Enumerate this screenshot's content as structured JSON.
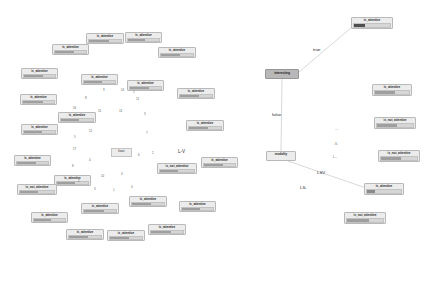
{
  "meta": {
    "left_panel_name": "attention-node-cluster",
    "right_panel_name": "decision-tree"
  },
  "labels": {
    "is_attentive": "is_attentive",
    "is_not_attentive": "is_not_attentive",
    "interesting": "interesting",
    "modality": "modality",
    "true": "true",
    "false": "false",
    "hour": "hour",
    "l_v": "L-V",
    "lsv": "LSV",
    "ls": "LS-",
    "l_dash": "L--",
    "s_dash": "-S-",
    "dash_dash": "---"
  },
  "left_cluster": {
    "nodes": [
      {
        "label": "is_attentive",
        "x": 86,
        "y": 33,
        "w": 38,
        "h": 11,
        "fill": 0.62
      },
      {
        "label": "is_attentive",
        "x": 125,
        "y": 32,
        "w": 37,
        "h": 11,
        "fill": 0.55
      },
      {
        "label": "is_attentive",
        "x": 52,
        "y": 44,
        "w": 37,
        "h": 11,
        "fill": 0.6
      },
      {
        "label": "is_attentive",
        "x": 158,
        "y": 47,
        "w": 38,
        "h": 11,
        "fill": 0.58
      },
      {
        "label": "is_attentive",
        "x": 21,
        "y": 68,
        "w": 37,
        "h": 11,
        "fill": 0.63
      },
      {
        "label": "is_attentive",
        "x": 81,
        "y": 74,
        "w": 37,
        "h": 11,
        "fill": 0.57
      },
      {
        "label": "is_attentive",
        "x": 127,
        "y": 80,
        "w": 37,
        "h": 11,
        "fill": 0.61
      },
      {
        "label": "is_attentive",
        "x": 177,
        "y": 88,
        "w": 38,
        "h": 11,
        "fill": 0.59
      },
      {
        "label": "is_attentive",
        "x": 20,
        "y": 94,
        "w": 37,
        "h": 11,
        "fill": 0.64
      },
      {
        "label": "is_attentive",
        "x": 58,
        "y": 112,
        "w": 38,
        "h": 11,
        "fill": 0.56
      },
      {
        "label": "is_attentive",
        "x": 186,
        "y": 120,
        "w": 38,
        "h": 11,
        "fill": 0.6
      },
      {
        "label": "is_attentive",
        "x": 21,
        "y": 124,
        "w": 37,
        "h": 11,
        "fill": 0.58
      },
      {
        "label": "is_attentive",
        "x": 14,
        "y": 155,
        "w": 37,
        "h": 11,
        "fill": 0.62
      },
      {
        "label": "is_not_attentive",
        "x": 157,
        "y": 163,
        "w": 40,
        "h": 11,
        "fill": 0.54
      },
      {
        "label": "is_attentive",
        "x": 201,
        "y": 157,
        "w": 37,
        "h": 11,
        "fill": 0.6
      },
      {
        "label": "is_attentive",
        "x": 54,
        "y": 175,
        "w": 37,
        "h": 11,
        "fill": 0.59
      },
      {
        "label": "is_not_attentive",
        "x": 17,
        "y": 184,
        "w": 40,
        "h": 11,
        "fill": 0.52
      },
      {
        "label": "is_attentive",
        "x": 129,
        "y": 196,
        "w": 38,
        "h": 11,
        "fill": 0.61
      },
      {
        "label": "is_attentive",
        "x": 179,
        "y": 201,
        "w": 37,
        "h": 11,
        "fill": 0.57
      },
      {
        "label": "is_attentive",
        "x": 81,
        "y": 203,
        "w": 38,
        "h": 11,
        "fill": 0.63
      },
      {
        "label": "is_attentive",
        "x": 31,
        "y": 212,
        "w": 37,
        "h": 11,
        "fill": 0.55
      },
      {
        "label": "is_attentive",
        "x": 66,
        "y": 229,
        "w": 38,
        "h": 11,
        "fill": 0.6
      },
      {
        "label": "is_attentive",
        "x": 107,
        "y": 230,
        "w": 38,
        "h": 11,
        "fill": 0.58
      },
      {
        "label": "is_attentive",
        "x": 148,
        "y": 224,
        "w": 38,
        "h": 11,
        "fill": 0.62
      }
    ],
    "scatter_numbers": [
      {
        "text": "9",
        "x": 103,
        "y": 89
      },
      {
        "text": "14",
        "x": 121,
        "y": 89
      },
      {
        "text": "1",
        "x": 133,
        "y": 91
      },
      {
        "text": "8",
        "x": 85,
        "y": 97
      },
      {
        "text": "11",
        "x": 136,
        "y": 98
      },
      {
        "text": "16",
        "x": 73,
        "y": 107
      },
      {
        "text": "15",
        "x": 98,
        "y": 110
      },
      {
        "text": "13",
        "x": 119,
        "y": 110
      },
      {
        "text": "3",
        "x": 144,
        "y": 113
      },
      {
        "text": "12",
        "x": 89,
        "y": 130
      },
      {
        "text": "7",
        "x": 146,
        "y": 132
      },
      {
        "text": "5",
        "x": 74,
        "y": 136
      },
      {
        "text": "17",
        "x": 73,
        "y": 148
      },
      {
        "text": "6",
        "x": 138,
        "y": 154
      },
      {
        "text": "2",
        "x": 152,
        "y": 152
      },
      {
        "text": "4",
        "x": 89,
        "y": 159
      },
      {
        "text": "8",
        "x": 72,
        "y": 165
      },
      {
        "text": "10",
        "x": 101,
        "y": 175
      },
      {
        "text": "4",
        "x": 121,
        "y": 173
      },
      {
        "text": "2",
        "x": 78,
        "y": 180
      },
      {
        "text": "3",
        "x": 94,
        "y": 188
      },
      {
        "text": "1",
        "x": 113,
        "y": 189
      },
      {
        "text": "4",
        "x": 131,
        "y": 186
      }
    ],
    "hour_box": {
      "label": "hour",
      "x": 111,
      "y": 148,
      "w": 21,
      "h": 9
    },
    "lv_label": {
      "text": "L-V",
      "x": 178,
      "y": 150
    }
  },
  "tree": {
    "nodes": [
      {
        "id": "root_leaf",
        "label": "is_attentive",
        "x": 351,
        "y": 17,
        "w": 42,
        "h": 12,
        "kind": "selected",
        "fill": 0.3
      },
      {
        "id": "interesting",
        "label": "interesting",
        "x": 265,
        "y": 69,
        "w": 34,
        "h": 10,
        "kind": "internal"
      },
      {
        "id": "modality",
        "label": "modality",
        "x": 266,
        "y": 151,
        "w": 30,
        "h": 10,
        "kind": "plain"
      },
      {
        "id": "leafA",
        "label": "is_attentive",
        "x": 372,
        "y": 84,
        "w": 40,
        "h": 12,
        "fill": 0.58
      },
      {
        "id": "leafB",
        "label": "is_not_attentive",
        "x": 374,
        "y": 117,
        "w": 42,
        "h": 12,
        "fill": 0.55
      },
      {
        "id": "leafC",
        "label": "is_not_attentive",
        "x": 378,
        "y": 150,
        "w": 42,
        "h": 12,
        "fill": 0.57
      },
      {
        "id": "leafD",
        "label": "is_attentive",
        "x": 364,
        "y": 183,
        "w": 40,
        "h": 12,
        "kind": "half",
        "fill": 0.22
      },
      {
        "id": "leafE",
        "label": "is_not_attentive",
        "x": 344,
        "y": 212,
        "w": 42,
        "h": 12,
        "fill": 0.6
      }
    ],
    "edges": [
      {
        "x1": 299,
        "y1": 72,
        "x2": 352,
        "y2": 27,
        "name": "edge-interesting-to-attentive"
      },
      {
        "x1": 282,
        "y1": 79,
        "x2": 281,
        "y2": 151,
        "name": "edge-interesting-to-modality"
      },
      {
        "x1": 288,
        "y1": 161,
        "x2": 366,
        "y2": 188,
        "name": "edge-modality-to-attentive"
      }
    ],
    "edge_labels": [
      {
        "text": "true",
        "x": 313,
        "y": 48
      },
      {
        "text": "false",
        "x": 272,
        "y": 113
      },
      {
        "text": "LSV",
        "x": 317,
        "y": 171
      },
      {
        "text": "LS-",
        "x": 300,
        "y": 186
      }
    ],
    "side_labels": [
      {
        "text": "---",
        "x": 335,
        "y": 128
      },
      {
        "text": "-S-",
        "x": 334,
        "y": 143
      },
      {
        "text": "L--",
        "x": 333,
        "y": 156
      }
    ]
  },
  "colors": {
    "node_fill": "#ececec",
    "node_border": "#b9b9b9",
    "internal_fill": "#b8b8b8",
    "bar_track": "#d6d6d6",
    "bar_value": "#9f9f9f",
    "bar_value_dark": "#4e4e4e",
    "edge": "#b0b0b0",
    "text": "#2a2a2a",
    "background": "#ffffff"
  }
}
